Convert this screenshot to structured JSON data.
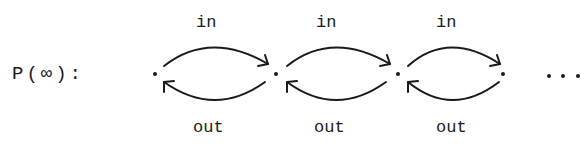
{
  "diagram": {
    "title_label": "P(∞):",
    "edge_label_top": "in",
    "edge_label_bottom": "out",
    "ellipsis": "...",
    "nodes": [
      {
        "x": 155,
        "y": 74
      },
      {
        "x": 276,
        "y": 74
      },
      {
        "x": 398,
        "y": 74
      },
      {
        "x": 503,
        "y": 74
      }
    ],
    "edges": [
      {
        "from": 0,
        "to": 1,
        "top": "in",
        "bottom": "out"
      },
      {
        "from": 1,
        "to": 2,
        "top": "in",
        "bottom": "out"
      },
      {
        "from": 2,
        "to": 3,
        "top": "in",
        "bottom": "out"
      }
    ],
    "stroke_color": "#1a1a1a"
  }
}
